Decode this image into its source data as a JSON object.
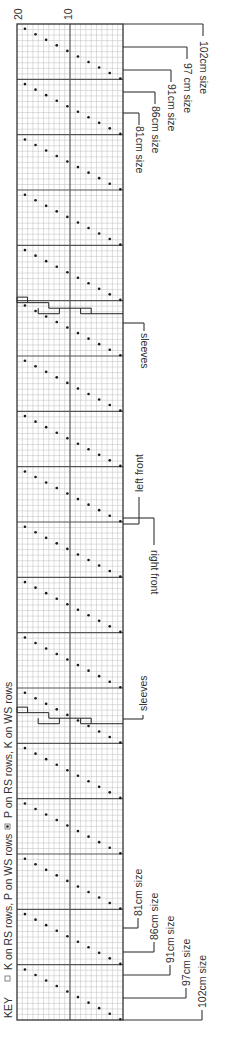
{
  "chart": {
    "axis_ticks": [
      {
        "label": "20",
        "x": 18
      },
      {
        "label": "10",
        "x": 68
      }
    ],
    "grid": {
      "left": 17,
      "right": 123,
      "top": 24,
      "bottom": 1020,
      "columns": 20,
      "stitches": 180,
      "major_every": 10,
      "minor_color": "#bdbdbd",
      "major_color": "#555555",
      "border_color": "#333333"
    },
    "dot_color": "#1a1a1a"
  },
  "key": {
    "title": "KEY",
    "items": [
      {
        "symbol": "empty-square",
        "label": "K on RS rows, P on WS rows"
      },
      {
        "symbol": "dot-square",
        "label": "P on RS rows, K on WS rows"
      }
    ]
  },
  "annotations": {
    "top_sizes": [
      {
        "label": "102cm size",
        "y": 24,
        "stem_x": 203
      },
      {
        "label": "97 cm size",
        "y": 47,
        "stem_x": 187
      },
      {
        "label": "91cm size",
        "y": 70,
        "stem_x": 171
      },
      {
        "label": "86cm size",
        "y": 92,
        "stem_x": 155
      },
      {
        "label": "81cm size",
        "y": 113,
        "stem_x": 139
      }
    ],
    "bottom_sizes": [
      {
        "label": "81cm size",
        "y": 928,
        "stem_x": 138
      },
      {
        "label": "86cm size",
        "y": 952,
        "stem_x": 154
      },
      {
        "label": "91cm size",
        "y": 975,
        "stem_x": 170
      },
      {
        "label": "97cm size",
        "y": 998,
        "stem_x": 186
      },
      {
        "label": "102cm size",
        "y": 1020,
        "stem_x": 202
      }
    ],
    "sleeves_top": {
      "label": "sleeves",
      "y": 323,
      "stem_x": 144
    },
    "left_front": {
      "label": "left front",
      "y": 524,
      "stem_x": 139
    },
    "right_front": {
      "label": "right front",
      "y": 518,
      "stem_x": 154
    },
    "sleeves_bottom": {
      "label": "sleeves",
      "y": 719,
      "stem_x": 143
    }
  }
}
